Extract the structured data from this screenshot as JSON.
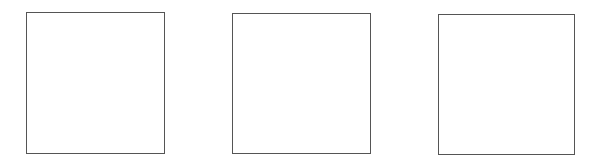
{
  "diagram": {
    "background_color": "#ffffff",
    "stroke_color": "#555555",
    "boxes": [
      {
        "id": "box-1",
        "label": ""
      },
      {
        "id": "box-2",
        "label": ""
      },
      {
        "id": "box-3",
        "label": ""
      }
    ]
  }
}
